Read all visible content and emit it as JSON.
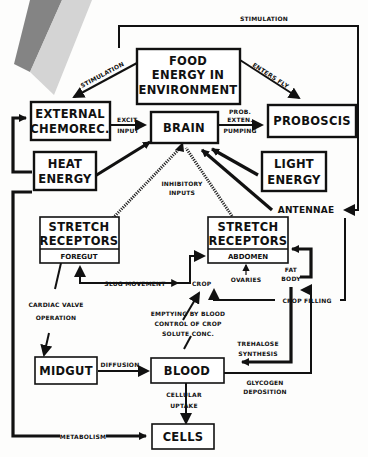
{
  "diagram": {
    "nodes": {
      "food": {
        "lines": [
          "FOOD",
          "ENERGY IN",
          "ENVIRONMENT"
        ]
      },
      "external": {
        "lines": [
          "EXTERNAL",
          "CHEMOREC."
        ]
      },
      "brain": {
        "lines": [
          "BRAIN"
        ]
      },
      "proboscis": {
        "lines": [
          "PROBOSCIS"
        ]
      },
      "heat": {
        "lines": [
          "HEAT",
          "ENERGY"
        ]
      },
      "light": {
        "lines": [
          "LIGHT",
          "ENERGY"
        ]
      },
      "stretch_foregut": {
        "lines": [
          "STRETCH",
          "RECEPTORS"
        ],
        "sub": "FOREGUT"
      },
      "stretch_abdomen": {
        "lines": [
          "STRETCH",
          "RECEPTORS"
        ],
        "sub": "ABDOMEN"
      },
      "midgut": {
        "lines": [
          "MIDGUT"
        ]
      },
      "blood": {
        "lines": [
          "BLOOD"
        ]
      },
      "cells": {
        "lines": [
          "CELLS"
        ]
      }
    },
    "labels": {
      "stimulation_top": "STIMULATION",
      "stimulation_left": "STIMULATION",
      "enters_fly": "ENTERS FLY",
      "excit": "EXCIT.",
      "input": "INPUT",
      "prob": "PROB.",
      "exten": "EXTEN.",
      "pumping": "PUMPING",
      "antennae": "ANTENNAE",
      "inhibitory": "INHIBITORY",
      "inputs": "INPUTS",
      "slug_movement": "SLUG MOVEMENT",
      "crop": "CROP",
      "ovaries": "OVARIES",
      "fat": "FAT",
      "body": "BODY",
      "crop_filling": "CROP FILLING",
      "cardiac_valve": "CARDIAC VALVE",
      "operation": "OPERATION",
      "emptying": "EMPTYING BY BLOOD",
      "control": "CONTROL OF CROP",
      "solute": "SOLUTE CONC.",
      "trehalose": "TREHALOSE",
      "synthesis": "SYNTHESIS",
      "glycogen": "GLYCOGEN",
      "deposition": "DEPOSITION",
      "diffusion": "DIFFUSION",
      "cellular": "CELLULAR",
      "uptake": "UPTAKE",
      "metabolism": "METABOLISM"
    },
    "colors": {
      "ink": "#111111",
      "paper": "#fdfdfc",
      "stripe_dark": "#6e6e6e",
      "stripe_light": "#c9c9c9"
    }
  }
}
